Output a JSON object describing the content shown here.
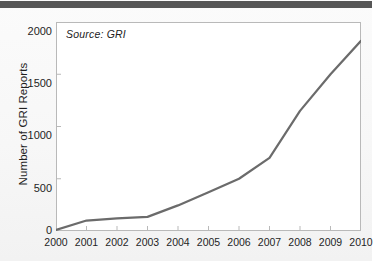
{
  "figure": {
    "source_note": "Source: GRI",
    "top_bar_color": "#565656",
    "line_color": "#6b6b6b",
    "axis_color": "#b9b9b9",
    "background_color": "#ffffff"
  },
  "chart_data": {
    "type": "line",
    "title": "",
    "xlabel": "",
    "ylabel": "Number of GRI Reports",
    "x": [
      2000,
      2001,
      2002,
      2003,
      2004,
      2005,
      2006,
      2007,
      2008,
      2009,
      2010
    ],
    "xtick_labels": [
      "2000",
      "2001",
      "2002",
      "2003",
      "2004",
      "2005",
      "2006",
      "2007",
      "2008",
      "2009",
      "2010"
    ],
    "values": [
      10,
      100,
      120,
      135,
      245,
      370,
      500,
      700,
      1150,
      1500,
      1820
    ],
    "ytick_labels": [
      "0",
      "500",
      "1000",
      "1500",
      "2000"
    ],
    "yticks": [
      0,
      500,
      1000,
      1500,
      2000
    ],
    "ylim": [
      0,
      2000
    ],
    "xlim": [
      2000,
      2010
    ],
    "grid": false,
    "legend": null,
    "annotations": [
      "Source: GRI"
    ],
    "series": [
      {
        "name": "Number of GRI Reports",
        "values": [
          10,
          100,
          120,
          135,
          245,
          370,
          500,
          700,
          1150,
          1500,
          1820
        ]
      }
    ]
  }
}
